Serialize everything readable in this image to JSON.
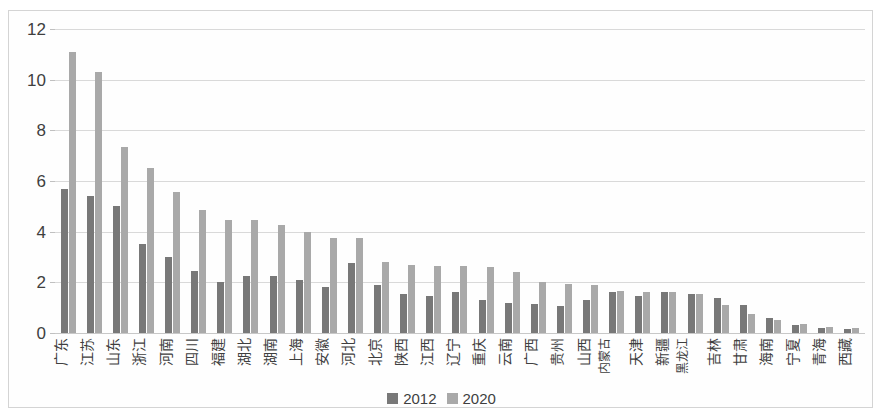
{
  "chart_data": {
    "type": "bar",
    "title": "",
    "subtitle": "",
    "xlabel": "",
    "ylabel": "",
    "ylim": [
      0,
      12
    ],
    "yticks": [
      0,
      2,
      4,
      6,
      8,
      10,
      12
    ],
    "grid": true,
    "legend_position": "bottom",
    "orientation": "vertical",
    "xlabel_rotation": -90,
    "categories": [
      "广东",
      "江苏",
      "山东",
      "浙江",
      "河南",
      "四川",
      "福建",
      "湖北",
      "湖南",
      "上海",
      "安徽",
      "河北",
      "北京",
      "陕西",
      "江西",
      "辽宁",
      "重庆",
      "云南",
      "广西",
      "贵州",
      "山西",
      "内蒙古",
      "天津",
      "新疆",
      "黑龙江",
      "吉林",
      "甘肃",
      "海南",
      "宁夏",
      "青海",
      "西藏"
    ],
    "series": [
      {
        "name": "2012",
        "color": "#787878",
        "values": [
          5.7,
          5.4,
          5.0,
          3.5,
          3.0,
          2.45,
          2.0,
          2.25,
          2.25,
          2.1,
          1.8,
          2.75,
          1.9,
          1.55,
          1.45,
          1.6,
          1.3,
          1.2,
          1.15,
          1.05,
          1.3,
          1.6,
          1.45,
          1.6,
          1.55,
          1.4,
          1.1,
          0.6,
          0.3,
          0.2,
          0.15
        ]
      },
      {
        "name": "2020",
        "color": "#a9a9a9",
        "values": [
          11.1,
          10.3,
          7.35,
          6.5,
          5.55,
          4.85,
          4.45,
          4.45,
          4.25,
          4.0,
          3.75,
          3.75,
          2.8,
          2.7,
          2.65,
          2.65,
          2.6,
          2.4,
          2.0,
          1.95,
          1.9,
          1.65,
          1.6,
          1.6,
          1.55,
          1.1,
          0.75,
          0.5,
          0.35,
          0.25,
          0.2
        ]
      }
    ]
  },
  "legend": {
    "items": [
      {
        "label": "2012",
        "color": "#787878"
      },
      {
        "label": "2020",
        "color": "#a9a9a9"
      }
    ]
  }
}
